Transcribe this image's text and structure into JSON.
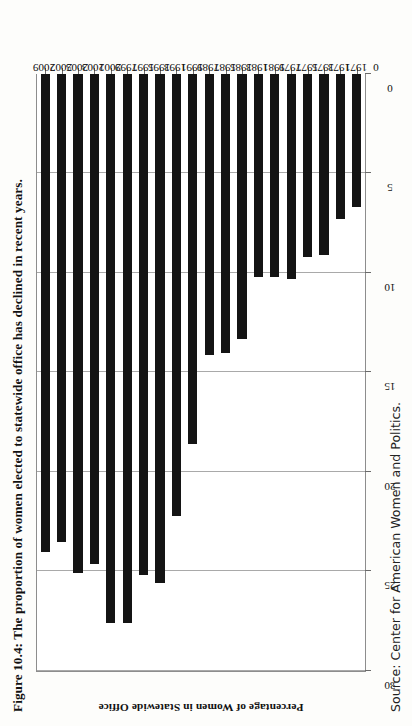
{
  "figure": {
    "title": "Figure 10.4: The proportion of women elected to statewide office has declined in recent years.",
    "source": "Source: Center for American Women and Politics."
  },
  "chart_data": {
    "type": "bar",
    "orientation": "vertical",
    "title": "Figure 10.4: The proportion of women elected to statewide office has declined in recent years.",
    "xlabel": "",
    "ylabel": "Percentage of Women in Statewide Office",
    "ylim": [
      0,
      30
    ],
    "yticks": [
      0,
      5,
      10,
      15,
      20,
      25,
      30
    ],
    "grid": true,
    "legend": false,
    "categories": [
      "1971",
      "1973",
      "1975",
      "1977",
      "1979",
      "1981",
      "1983",
      "1985",
      "1987",
      "1989",
      "1991",
      "1993",
      "1995",
      "1997",
      "1999",
      "2001",
      "2003",
      "2005",
      "2007",
      "2009"
    ],
    "values": [
      6.7,
      7.3,
      9.1,
      9.2,
      10.3,
      10.2,
      10.2,
      13.3,
      14.0,
      14.1,
      18.6,
      22.2,
      25.6,
      25.2,
      27.6,
      27.6,
      24.6,
      25.1,
      23.5,
      24.0
    ]
  },
  "axis": {
    "y_title": "Percentage of Women in Statewide Office",
    "tick_labels": [
      "30",
      "25",
      "20",
      "15",
      "10",
      "5",
      "0"
    ],
    "zero_label": "0"
  }
}
